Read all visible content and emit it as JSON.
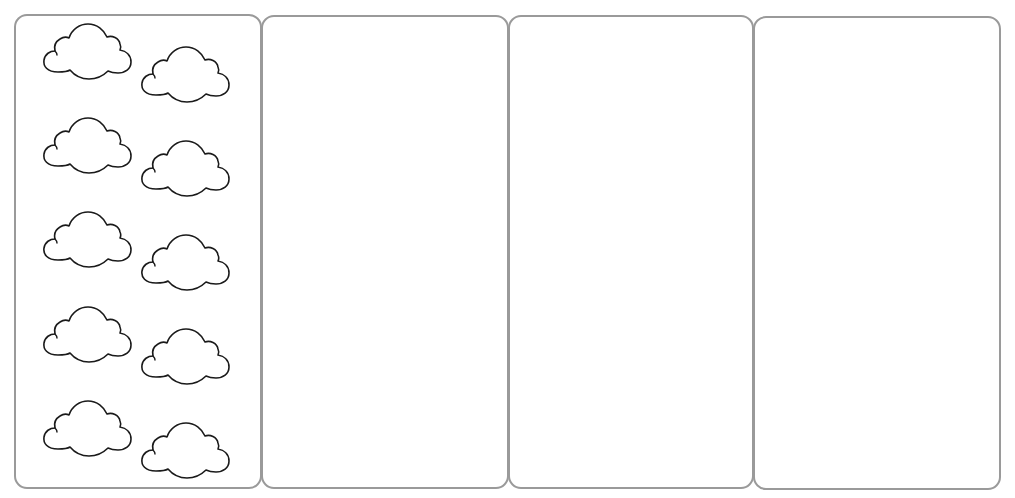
{
  "worksheet": {
    "panels": [
      {
        "id": "panel-1",
        "left": 14,
        "top": 14,
        "width": 248,
        "height": 475,
        "cloud_count": 10
      },
      {
        "id": "panel-2",
        "left": 261,
        "top": 15,
        "width": 248,
        "height": 474,
        "cloud_count": 0
      },
      {
        "id": "panel-3",
        "left": 508,
        "top": 15,
        "width": 246,
        "height": 474,
        "cloud_count": 0
      },
      {
        "id": "panel-4",
        "left": 753,
        "top": 16,
        "width": 248,
        "height": 474,
        "cloud_count": 0
      }
    ],
    "clouds": [
      {
        "x": 42,
        "y": 22
      },
      {
        "x": 140,
        "y": 45
      },
      {
        "x": 42,
        "y": 116
      },
      {
        "x": 140,
        "y": 139
      },
      {
        "x": 42,
        "y": 210
      },
      {
        "x": 140,
        "y": 233
      },
      {
        "x": 42,
        "y": 305
      },
      {
        "x": 140,
        "y": 327
      },
      {
        "x": 42,
        "y": 399
      },
      {
        "x": 140,
        "y": 421
      }
    ],
    "colors": {
      "panel_border": "#9a9a9a",
      "cloud_stroke": "#1a1a1a",
      "background": "#ffffff"
    }
  }
}
